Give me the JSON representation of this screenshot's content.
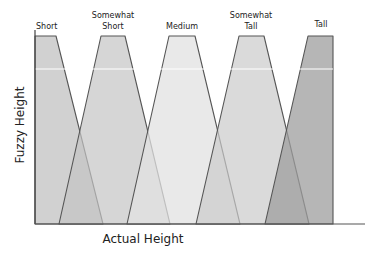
{
  "chart_data": {
    "type": "area",
    "title": "",
    "xlabel": "Actual Height",
    "ylabel": "Fuzzy Height",
    "grid": false,
    "legend_position": "none",
    "series": [
      {
        "name": "Short",
        "label_lines": [
          "Short"
        ],
        "shape": "trapezoid",
        "points": [
          [
            35,
            224
          ],
          [
            35,
            36
          ],
          [
            56,
            36
          ],
          [
            103,
            224
          ]
        ],
        "fill": "#c9c9c9",
        "opacity": 0.85
      },
      {
        "name": "Somewhat Short",
        "label_lines": [
          "Somewhat",
          "Short"
        ],
        "shape": "trapezoid",
        "points": [
          [
            59,
            224
          ],
          [
            101,
            36
          ],
          [
            125,
            36
          ],
          [
            170,
            224
          ]
        ],
        "fill": "#c4c4c4",
        "opacity": 0.7
      },
      {
        "name": "Medium",
        "label_lines": [
          "Medium"
        ],
        "shape": "trapezoid",
        "points": [
          [
            127,
            224
          ],
          [
            169,
            36
          ],
          [
            195,
            36
          ],
          [
            240,
            224
          ]
        ],
        "fill": "#e2e2e2",
        "opacity": 0.75
      },
      {
        "name": "Somewhat Tall",
        "label_lines": [
          "Somewhat",
          "Tall"
        ],
        "shape": "trapezoid",
        "points": [
          [
            196,
            224
          ],
          [
            239,
            36
          ],
          [
            264,
            36
          ],
          [
            309,
            224
          ]
        ],
        "fill": "#cbcbcb",
        "opacity": 0.7
      },
      {
        "name": "Tall",
        "label_lines": [
          "Tall"
        ],
        "shape": "trapezoid",
        "points": [
          [
            265,
            224
          ],
          [
            308,
            36
          ],
          [
            333,
            36
          ],
          [
            333,
            224
          ]
        ],
        "fill": "#9e9e9e",
        "opacity": 0.75
      }
    ],
    "reference_line_y": 69,
    "axis": {
      "origin_x": 35,
      "top_y": 30,
      "baseline_y": 224,
      "end_x": 365
    }
  },
  "labels": {
    "xlabel": "Actual Height",
    "ylabel": "Fuzzy Height",
    "short": "Short",
    "somewhat_short_1": "Somewhat",
    "somewhat_short_2": "Short",
    "medium": "Medium",
    "somewhat_tall_1": "Somewhat",
    "somewhat_tall_2": "Tall",
    "tall": "Tall"
  }
}
